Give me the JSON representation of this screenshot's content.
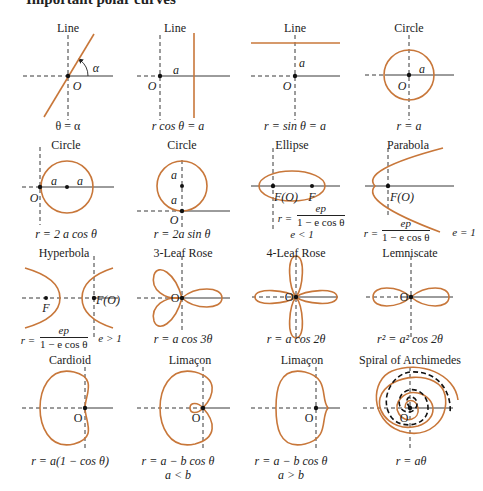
{
  "heading": "Important polar curves",
  "curve_color": "#c8773a",
  "axis_color": "#222222",
  "curves": [
    {
      "name": "line-through-origin",
      "title": "Line",
      "equation": "θ = α",
      "labels": [
        "α",
        "O"
      ]
    },
    {
      "name": "vertical-line",
      "title": "Line",
      "equation": "r cos θ = a",
      "labels": [
        "a",
        "O"
      ]
    },
    {
      "name": "horizontal-line",
      "title": "Line",
      "equation": "r = sin θ = a",
      "labels": [
        "a",
        "O"
      ]
    },
    {
      "name": "circle-centered",
      "title": "Circle",
      "equation": "r = a",
      "labels": [
        "a",
        "O"
      ]
    },
    {
      "name": "circle-cos",
      "title": "Circle",
      "equation": "r = 2 a cos θ",
      "labels": [
        "a",
        "a",
        "O"
      ]
    },
    {
      "name": "circle-sin",
      "title": "Circle",
      "equation": "r = 2a sin θ",
      "labels": [
        "a",
        "a",
        "O"
      ]
    },
    {
      "name": "ellipse",
      "title": "Ellipse",
      "equation_prefix": "r =",
      "numerator": "ep",
      "denominator": "1 − e cos θ",
      "condition": "e < 1",
      "labels": [
        "F(O)",
        "F"
      ]
    },
    {
      "name": "parabola",
      "title": "Parabola",
      "equation_prefix": "r =",
      "numerator": "ep",
      "denominator": "1 − e cos θ",
      "condition": "e = 1",
      "labels": [
        "F(O)"
      ]
    },
    {
      "name": "hyperbola",
      "title": "Hyperbola",
      "equation_prefix": "r =",
      "numerator": "ep",
      "denominator": "1 − e cos θ",
      "condition": "e > 1",
      "labels": [
        "F",
        "F(O)"
      ]
    },
    {
      "name": "three-leaf-rose",
      "title": "3-Leaf Rose",
      "equation": "r = a cos 3θ",
      "labels": [
        "O"
      ]
    },
    {
      "name": "four-leaf-rose",
      "title": "4-Leaf Rose",
      "equation": "r = a cos 2θ",
      "labels": [
        "O"
      ]
    },
    {
      "name": "lemniscate",
      "title": "Lemniscate",
      "equation": "r² = a² cos 2θ",
      "labels": [
        "O"
      ]
    },
    {
      "name": "cardioid",
      "title": "Cardioid",
      "equation": "r = a(1 − cos θ)",
      "labels": [
        "O"
      ]
    },
    {
      "name": "limacon-inner-loop",
      "title": "Limaçon",
      "equation": "r = a − b cos θ",
      "condition": "a < b",
      "labels": [
        "O"
      ]
    },
    {
      "name": "limacon-dimpled",
      "title": "Limaçon",
      "equation": "r = a − b cos θ",
      "condition": "a > b",
      "labels": [
        "O"
      ]
    },
    {
      "name": "spiral-of-archimedes",
      "title": "Spiral of Archimedes",
      "equation": "r = aθ",
      "labels": [
        "O"
      ]
    }
  ]
}
